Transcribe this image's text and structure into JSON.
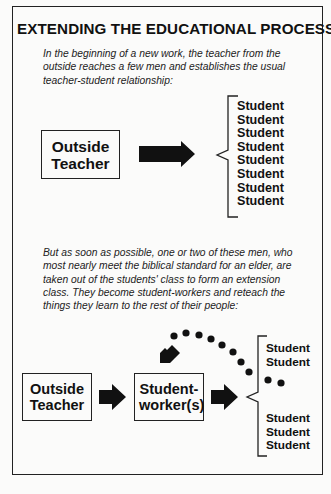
{
  "title": "EXTENDING THE EDUCATIONAL PROCESS",
  "intro_text": "In the beginning of a new work, the teacher from the outside reaches a few men and establishes the usual teacher-student relationship:",
  "stage1": {
    "source_box": "Outside Teacher",
    "students": [
      "Student",
      "Student",
      "Student",
      "Student",
      "Student",
      "Student",
      "Student",
      "Student"
    ]
  },
  "transition_text": "But as soon as possible, one or two of these men, who most nearly meet the biblical standard for an elder, are taken out of the students' class to form an extension class. They become student-workers and reteach the things they learn to the rest of their people:",
  "stage2": {
    "source_box": "Outside Teacher",
    "middle_box": "Student-worker(s)",
    "students_top": [
      "Student",
      "Student"
    ],
    "students_bottom": [
      "Student",
      "Student",
      "Student"
    ]
  },
  "icons": {
    "arrow": "right-arrow-icon",
    "brace": "left-brace-icon",
    "return_path": "dotted-curved-arrow-icon"
  }
}
